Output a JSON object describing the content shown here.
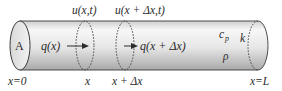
{
  "diagram": {
    "end_labels": {
      "left": "x=0",
      "right": "x=L"
    },
    "cross_section_area_label": "A",
    "positions": [
      {
        "id": "x",
        "bottom_label": "x",
        "top_label": "u(x,t)"
      },
      {
        "id": "x_plus_dx",
        "bottom_label": "x + Δx",
        "top_label": "u(x + Δx,t)"
      }
    ],
    "flux": [
      {
        "label": "q(x)"
      },
      {
        "label": "q(x + Δx)"
      }
    ],
    "material_properties": {
      "specific_heat": "c",
      "specific_heat_sub": "p",
      "conductivity": "k",
      "density": "ρ"
    },
    "colors": {
      "rod_light": "#f4f4f4",
      "rod_mid": "#dcdcdc",
      "rod_dark": "#b4b4b4",
      "outline": "#3a3a3a",
      "text": "#2b2b2b"
    }
  }
}
